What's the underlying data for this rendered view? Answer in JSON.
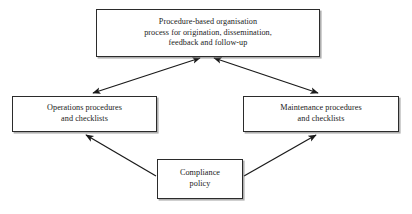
{
  "diagram": {
    "type": "flowchart",
    "background_color": "#ffffff",
    "line_color": "#1a1a1a",
    "box_border_color": "#2b2b2b",
    "nodes": [
      {
        "id": "top",
        "label": "Procedure-based organisation\nprocess for origination, dissemination,\nfeedback and follow-up",
        "x": 96,
        "y": 9,
        "width": 224,
        "height": 48
      },
      {
        "id": "operations",
        "label": "Operations procedures\nand checklists",
        "x": 12,
        "y": 96,
        "width": 145,
        "height": 36
      },
      {
        "id": "maintenance",
        "label": "Maintenance procedures\nand checklists",
        "x": 243,
        "y": 96,
        "width": 156,
        "height": 36
      },
      {
        "id": "compliance",
        "label": "Compliance\npolicy",
        "x": 157,
        "y": 159,
        "width": 86,
        "height": 40
      }
    ],
    "edges": [
      {
        "id": "top-operations",
        "from": "top",
        "to": "operations",
        "direction": "bidirectional",
        "x1": 200,
        "y1": 58,
        "x2": 93,
        "y2": 93
      },
      {
        "id": "top-maintenance",
        "from": "top",
        "to": "maintenance",
        "direction": "bidirectional",
        "x1": 214,
        "y1": 58,
        "x2": 318,
        "y2": 93
      },
      {
        "id": "compliance-operations",
        "from": "compliance",
        "to": "operations",
        "direction": "single",
        "x1": 156,
        "y1": 176,
        "x2": 86,
        "y2": 135
      },
      {
        "id": "compliance-maintenance",
        "from": "compliance",
        "to": "maintenance",
        "direction": "single",
        "x1": 244,
        "y1": 176,
        "x2": 316,
        "y2": 135
      }
    ]
  }
}
